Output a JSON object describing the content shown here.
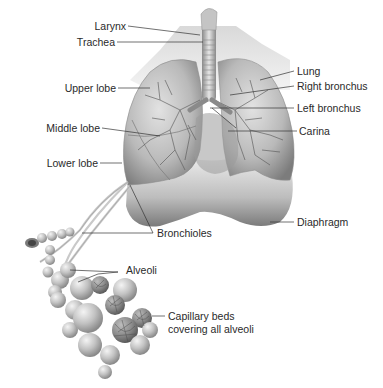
{
  "diagram": {
    "labels": {
      "larynx": "Larynx",
      "trachea": "Trachea",
      "upper_lobe": "Upper lobe",
      "middle_lobe": "Middle lobe",
      "lower_lobe": "Lower lobe",
      "lung": "Lung",
      "right_bronchus": "Right bronchus",
      "left_bronchus": "Left bronchus",
      "carina": "Carina",
      "diaphragm": "Diaphragm",
      "bronchioles": "Bronchioles",
      "alveoli": "Alveoli",
      "capillary_beds_line1": "Capillary beds",
      "capillary_beds_line2": "covering all alveoli"
    },
    "colors": {
      "background": "#ffffff",
      "label_text": "#2a2a2a",
      "leader_line": "#333333",
      "tissue_light": "#d6d6d6",
      "tissue_mid": "#a8a8a8",
      "tissue_dark": "#6e6e6e"
    }
  }
}
